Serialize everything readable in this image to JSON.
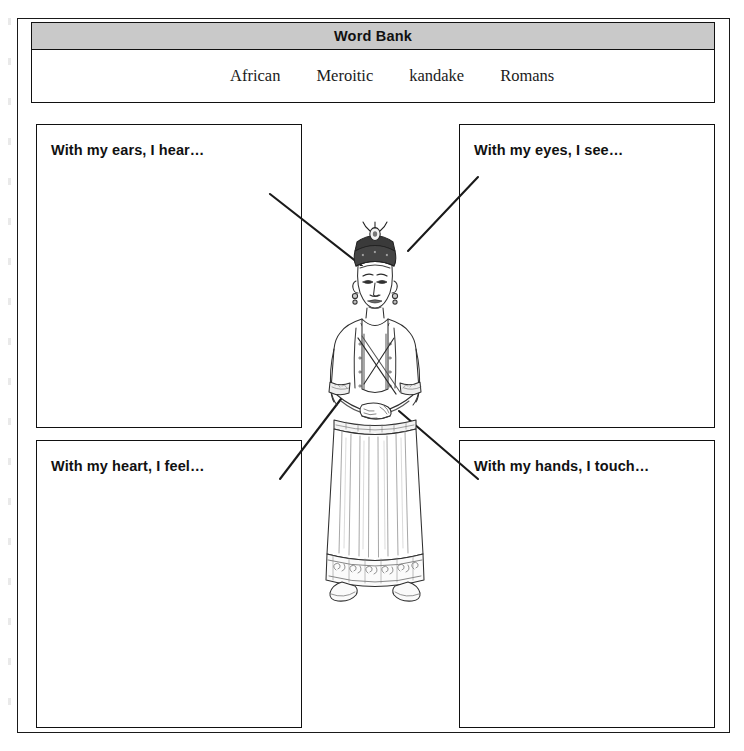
{
  "worksheet": {
    "word_bank": {
      "title": "Word Bank",
      "words": [
        "African",
        "Meroitic",
        "kandake",
        "Romans"
      ],
      "header_bg": "#c9c9c9",
      "border_color": "#111111"
    },
    "sense_boxes": [
      {
        "id": "ears",
        "label": "With my ears, I hear…"
      },
      {
        "id": "eyes",
        "label": "With my eyes, I see…"
      },
      {
        "id": "heart",
        "label": "With my heart, I feel…"
      },
      {
        "id": "hands",
        "label": "With my hands, I touch…"
      }
    ],
    "illustration": {
      "name": "kandake-figure",
      "description": "Line drawing of a Kushite kandake (queen) wearing a crowned headdress with uraeus, earrings, beaded necklace, sashed robe and long pleated gown with decorated hem and sandals",
      "line_color": "#2a2a2a"
    },
    "connectors": [
      {
        "from": "ears-box",
        "to": "figure-ear",
        "x1": 270,
        "y1": 194,
        "x2": 362,
        "y2": 266
      },
      {
        "from": "eyes-box",
        "to": "figure-eye",
        "x1": 478,
        "y1": 177,
        "x2": 408,
        "y2": 251
      },
      {
        "from": "heart-box",
        "to": "figure-heart",
        "x1": 280,
        "y1": 479,
        "x2": 341,
        "y2": 399
      },
      {
        "from": "hands-box",
        "to": "figure-hands",
        "x1": 478,
        "y1": 479,
        "x2": 399,
        "y2": 411
      }
    ]
  }
}
